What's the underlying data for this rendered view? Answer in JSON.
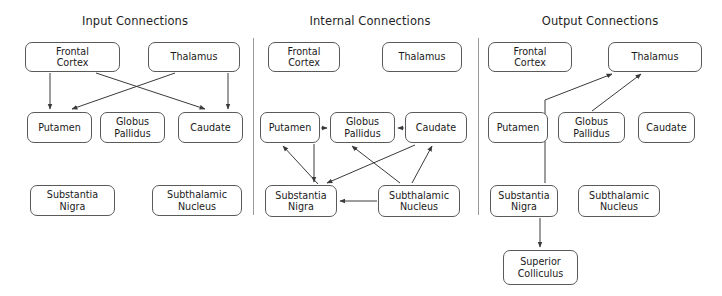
{
  "figure": {
    "width": 722,
    "height": 296,
    "background": "#ffffff",
    "stroke_color": "#3a3a3a",
    "box_border_color": "#5a5a5a",
    "divider_color": "#9a9a9a"
  },
  "panels": [
    {
      "id": "input",
      "title": "Input Connections",
      "nodes": [
        {
          "id": "input-frontal-cortex",
          "label": "Frontal\nCortex",
          "x": 25,
          "y": 42,
          "w": 95,
          "h": 30
        },
        {
          "id": "input-thalamus",
          "label": "Thalamus",
          "x": 148,
          "y": 42,
          "w": 92,
          "h": 30
        },
        {
          "id": "input-putamen",
          "label": "Putamen",
          "x": 27,
          "y": 112,
          "w": 65,
          "h": 31
        },
        {
          "id": "input-globus-pallidus",
          "label": "Globus\nPallidus",
          "x": 100,
          "y": 112,
          "w": 65,
          "h": 31
        },
        {
          "id": "input-caudate",
          "label": "Caudate",
          "x": 178,
          "y": 112,
          "w": 65,
          "h": 31
        },
        {
          "id": "input-substantia-nigra",
          "label": "Substantia\nNigra",
          "x": 30,
          "y": 185,
          "w": 85,
          "h": 31
        },
        {
          "id": "input-subthalamic-nucleus",
          "label": "Subthalamic\nNucleus",
          "x": 152,
          "y": 185,
          "w": 90,
          "h": 31
        }
      ],
      "edges": [
        {
          "from": "Frontal Cortex",
          "to": "Putamen"
        },
        {
          "from": "Frontal Cortex",
          "to": "Caudate"
        },
        {
          "from": "Thalamus",
          "to": "Putamen"
        },
        {
          "from": "Thalamus",
          "to": "Caudate"
        }
      ]
    },
    {
      "id": "internal",
      "title": "Internal Connections",
      "nodes": [
        {
          "id": "internal-frontal-cortex",
          "label": "Frontal\nCortex",
          "x": 268,
          "y": 42,
          "w": 72,
          "h": 30
        },
        {
          "id": "internal-thalamus",
          "label": "Thalamus",
          "x": 382,
          "y": 42,
          "w": 80,
          "h": 30
        },
        {
          "id": "internal-putamen",
          "label": "Putamen",
          "x": 260,
          "y": 112,
          "w": 60,
          "h": 31
        },
        {
          "id": "internal-globus-pallidus",
          "label": "Globus\nPallidus",
          "x": 330,
          "y": 112,
          "w": 65,
          "h": 31
        },
        {
          "id": "internal-caudate",
          "label": "Caudate",
          "x": 405,
          "y": 112,
          "w": 62,
          "h": 31
        },
        {
          "id": "internal-substantia-nigra",
          "label": "Substantia\nNigra",
          "x": 265,
          "y": 185,
          "w": 72,
          "h": 32
        },
        {
          "id": "internal-subthalamic-nucleus",
          "label": "Subthalamic\nNucleus",
          "x": 378,
          "y": 185,
          "w": 82,
          "h": 32
        }
      ],
      "edges": [
        {
          "from": "Putamen",
          "to": "Globus Pallidus"
        },
        {
          "from": "Caudate",
          "to": "Globus Pallidus"
        },
        {
          "from": "Globus Pallidus",
          "to": "Substantia Nigra"
        },
        {
          "from": "Substantia Nigra",
          "to": "Putamen"
        },
        {
          "from": "Subthalamic Nucleus",
          "to": "Substantia Nigra"
        },
        {
          "from": "Subthalamic Nucleus",
          "to": "Globus Pallidus"
        },
        {
          "from": "Subthalamic Nucleus",
          "to": "Caudate"
        },
        {
          "from": "Caudate",
          "to": "Substantia Nigra"
        }
      ]
    },
    {
      "id": "output",
      "title": "Output Connections",
      "nodes": [
        {
          "id": "output-frontal-cortex",
          "label": "Frontal\nCortex",
          "x": 488,
          "y": 42,
          "w": 84,
          "h": 30
        },
        {
          "id": "output-thalamus",
          "label": "Thalamus",
          "x": 608,
          "y": 42,
          "w": 94,
          "h": 30
        },
        {
          "id": "output-putamen",
          "label": "Putamen",
          "x": 488,
          "y": 112,
          "w": 60,
          "h": 31
        },
        {
          "id": "output-globus-pallidus",
          "label": "Globus\nPallidus",
          "x": 558,
          "y": 112,
          "w": 67,
          "h": 31
        },
        {
          "id": "output-caudate",
          "label": "Caudate",
          "x": 638,
          "y": 112,
          "w": 57,
          "h": 31
        },
        {
          "id": "output-substantia-nigra",
          "label": "Substantia\nNigra",
          "x": 490,
          "y": 185,
          "w": 68,
          "h": 32
        },
        {
          "id": "output-subthalamic-nucleus",
          "label": "Subthalamic\nNucleus",
          "x": 578,
          "y": 185,
          "w": 82,
          "h": 32
        },
        {
          "id": "output-superior-colliculus",
          "label": "Superior\nColliculus",
          "x": 503,
          "y": 250,
          "w": 75,
          "h": 35
        }
      ],
      "edges": [
        {
          "from": "Substantia Nigra",
          "to": "Thalamus"
        },
        {
          "from": "Globus Pallidus",
          "to": "Thalamus"
        },
        {
          "from": "Substantia Nigra",
          "to": "Superior Colliculus"
        }
      ]
    }
  ],
  "dividers": [
    {
      "id": "divider-input-internal",
      "x": 253,
      "y": 38,
      "h": 177
    },
    {
      "id": "divider-internal-output",
      "x": 478,
      "y": 38,
      "h": 177
    }
  ],
  "titles": {
    "input": {
      "x": 35,
      "y": 14,
      "w": 200
    },
    "internal": {
      "x": 270,
      "y": 14,
      "w": 200
    },
    "output": {
      "x": 500,
      "y": 14,
      "w": 200
    }
  }
}
